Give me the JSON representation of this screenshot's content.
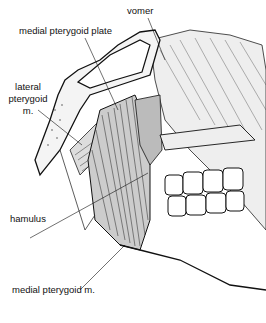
{
  "figure": {
    "labels": {
      "vomer": "vomer",
      "medial_pterygoid_plate": "medial  pterygoid  plate",
      "lateral_pterygoid_line1": "lateral",
      "lateral_pterygoid_line2": "pterygoid",
      "lateral_pterygoid_line3": "m.",
      "hamulus": "hamulus",
      "medial_pterygoid_muscle": "medial  pterygoid  m."
    }
  }
}
